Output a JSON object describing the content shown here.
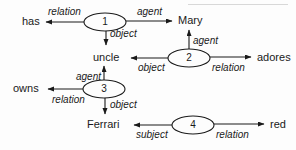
{
  "diagram": {
    "background_color": "#fdfdfd",
    "stroke_color": "#1a1a1a",
    "concepts": [
      {
        "id": "has",
        "label": "has",
        "x": 22,
        "y": 18
      },
      {
        "id": "mary",
        "label": "Mary",
        "x": 178,
        "y": 17
      },
      {
        "id": "uncle",
        "label": "uncle",
        "x": 93,
        "y": 53
      },
      {
        "id": "adores",
        "label": "adores",
        "x": 257,
        "y": 53
      },
      {
        "id": "owns",
        "label": "owns",
        "x": 13,
        "y": 84
      },
      {
        "id": "ferrari",
        "label": "Ferrari",
        "x": 87,
        "y": 120
      },
      {
        "id": "red",
        "label": "red",
        "x": 270,
        "y": 120
      }
    ],
    "relation_nodes": [
      {
        "id": "r1",
        "label": "1",
        "cx": 105,
        "cy": 22,
        "rx": 21,
        "ry": 9
      },
      {
        "id": "r2",
        "label": "2",
        "cx": 189,
        "cy": 58,
        "rx": 21,
        "ry": 9
      },
      {
        "id": "r3",
        "label": "3",
        "cx": 104,
        "cy": 89,
        "rx": 21,
        "ry": 9
      },
      {
        "id": "r4",
        "label": "4",
        "cx": 193,
        "cy": 125,
        "rx": 21,
        "ry": 9
      }
    ],
    "edges": [
      {
        "id": "e1",
        "from": "r1",
        "to": "has",
        "label": "relation",
        "lx": 48,
        "ly": 8
      },
      {
        "id": "e2",
        "from": "r1",
        "to": "mary",
        "label": "agent",
        "lx": 137,
        "ly": 8
      },
      {
        "id": "e3",
        "from": "r1",
        "to": "uncle",
        "label": "object",
        "lx": 110,
        "ly": 30
      },
      {
        "id": "e4",
        "from": "r2",
        "to": "mary",
        "label": "agent",
        "lx": 193,
        "ly": 37
      },
      {
        "id": "e5",
        "from": "r2",
        "to": "uncle",
        "label": "object",
        "lx": 138,
        "ly": 64
      },
      {
        "id": "e6",
        "from": "r2",
        "to": "adores",
        "label": "relation",
        "lx": 212,
        "ly": 64
      },
      {
        "id": "e7",
        "from": "r3",
        "to": "uncle",
        "label": "agent",
        "lx": 76,
        "ly": 73
      },
      {
        "id": "e8",
        "from": "r3",
        "to": "owns",
        "label": "relation",
        "lx": 52,
        "ly": 96
      },
      {
        "id": "e9",
        "from": "r3",
        "to": "ferrari",
        "label": "object",
        "lx": 110,
        "ly": 101
      },
      {
        "id": "e10",
        "from": "r4",
        "to": "ferrari",
        "label": "subject",
        "lx": 136,
        "ly": 131
      },
      {
        "id": "e11",
        "from": "r4",
        "to": "red",
        "label": "relation",
        "lx": 216,
        "ly": 131
      }
    ]
  }
}
